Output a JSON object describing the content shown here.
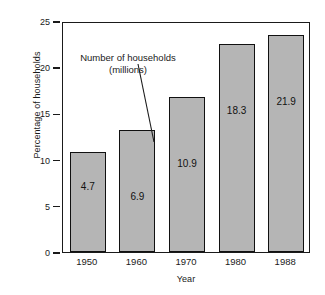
{
  "chart_data": {
    "type": "bar",
    "title": "",
    "xlabel": "Year",
    "ylabel": "Percentage of households",
    "categories": [
      "1950",
      "1960",
      "1970",
      "1980",
      "1988"
    ],
    "values": [
      10.8,
      13.2,
      16.8,
      22.5,
      23.5
    ],
    "bar_labels": [
      "4.7",
      "6.9",
      "10.9",
      "18.3",
      "21.9"
    ],
    "ylim": [
      0,
      25
    ],
    "yticks": [
      "0",
      "5",
      "10",
      "15",
      "20",
      "25"
    ],
    "ytick_values": [
      0,
      5,
      10,
      15,
      20,
      25
    ],
    "grid": false,
    "legend": null,
    "annotations": [
      {
        "text_line1": "Number of households",
        "text_line2": "(millions)",
        "points_to": "6.9"
      }
    ],
    "colors": {
      "bar_fill": "#b5b5b5",
      "bar_border": "#111111",
      "axis": "#1a1a1a",
      "background": "#ffffff"
    }
  }
}
